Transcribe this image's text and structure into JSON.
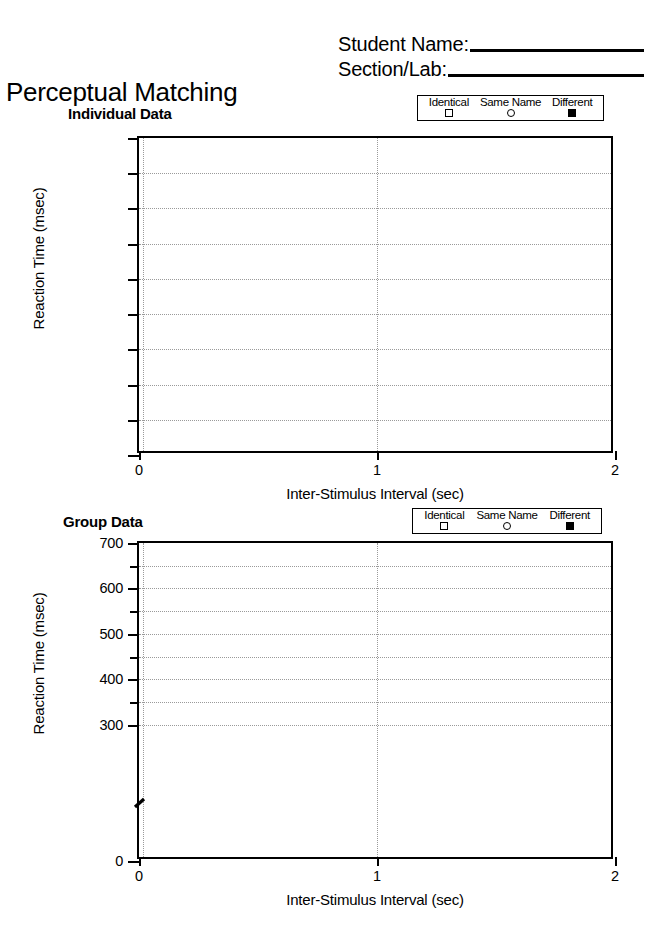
{
  "header": {
    "student_name_label": "Student Name:",
    "section_lab_label": "Section/Lab:"
  },
  "document": {
    "title": "Perceptual Matching"
  },
  "legend": {
    "items": [
      {
        "label": "Identical",
        "marker": "square-open"
      },
      {
        "label": "Same Name",
        "marker": "circle-open"
      },
      {
        "label": "Different",
        "marker": "square-filled"
      }
    ]
  },
  "chart_data": [
    {
      "type": "scatter",
      "title": "Individual Data",
      "xlabel": "Inter-Stimulus Interval (sec)",
      "ylabel": "Reaction Time (msec)",
      "x": [],
      "series": [
        {
          "name": "Identical",
          "marker": "square-open",
          "values": []
        },
        {
          "name": "Same Name",
          "marker": "circle-open",
          "values": []
        },
        {
          "name": "Different",
          "marker": "square-filled",
          "values": []
        }
      ],
      "xlim": [
        0,
        2
      ],
      "xticks": [
        0,
        1,
        2
      ],
      "xticklabels": [
        "0",
        "1",
        "2"
      ],
      "ylim": [
        0,
        9
      ],
      "yticks": [
        0,
        1,
        2,
        3,
        4,
        5,
        6,
        7,
        8,
        9
      ],
      "yticklabels": [
        "",
        "",
        "",
        "",
        "",
        "",
        "",
        "",
        "",
        ""
      ],
      "grid": true,
      "axis_break": false,
      "legend_position": "top-right",
      "note": "Blank worksheet grid — no data points plotted"
    },
    {
      "type": "scatter",
      "title": "Group Data",
      "xlabel": "Inter-Stimulus Interval (sec)",
      "ylabel": "Reaction Time (msec)",
      "x": [],
      "series": [
        {
          "name": "Identical",
          "marker": "square-open",
          "values": []
        },
        {
          "name": "Same Name",
          "marker": "circle-open",
          "values": []
        },
        {
          "name": "Different",
          "marker": "square-filled",
          "values": []
        }
      ],
      "xlim": [
        0,
        2
      ],
      "xticks": [
        0,
        1,
        2
      ],
      "xticklabels": [
        "0",
        "1",
        "2"
      ],
      "ylim": [
        0,
        700
      ],
      "yticks": [
        0,
        300,
        400,
        500,
        600,
        700
      ],
      "yticklabels": [
        "0",
        "300",
        "400",
        "500",
        "600",
        "700"
      ],
      "minor_yticks": [
        350,
        450,
        550,
        650
      ],
      "grid": true,
      "axis_break": true,
      "axis_break_between": [
        0,
        300
      ],
      "legend_position": "top-right",
      "note": "Blank worksheet grid — no data points plotted"
    }
  ]
}
